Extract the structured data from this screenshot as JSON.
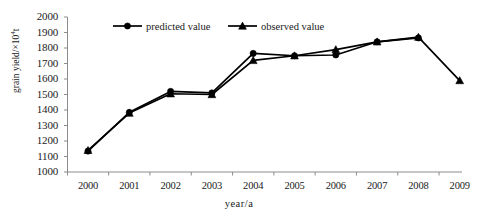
{
  "chart_data": {
    "type": "line",
    "title": "",
    "xlabel": "year/a",
    "ylabel": "grain yield/×10⁴t",
    "ylabel_base": "grain yield/×10",
    "ylabel_exp": "4",
    "ylabel_unit": "t",
    "categories": [
      "2000",
      "2001",
      "2002",
      "2003",
      "2004",
      "2005",
      "2006",
      "2007",
      "2008",
      "2009"
    ],
    "x": [
      2000,
      2001,
      2002,
      2003,
      2004,
      2005,
      2006,
      2007,
      2008,
      2009
    ],
    "xlim": [
      2000,
      2009
    ],
    "ylim": [
      1000,
      2000
    ],
    "ytick_labels": [
      "2000",
      "1900",
      "1800",
      "1700",
      "1600",
      "1500",
      "1400",
      "1300",
      "1200",
      "1100",
      "1000"
    ],
    "ytick_values": [
      2000,
      1900,
      1800,
      1700,
      1600,
      1500,
      1400,
      1300,
      1200,
      1100,
      1000
    ],
    "ytick_step": 100,
    "grid": false,
    "legend_position": "top-center",
    "series": [
      {
        "name": "predicted value",
        "marker": "circle",
        "color": "#000000",
        "values": [
          1135,
          1385,
          1520,
          1510,
          1765,
          1750,
          1755,
          1840,
          1865,
          null
        ]
      },
      {
        "name": "observed value",
        "marker": "triangle",
        "color": "#000000",
        "values": [
          1140,
          1380,
          1505,
          1500,
          1720,
          1750,
          1790,
          1840,
          1870,
          1590
        ]
      }
    ]
  },
  "legend": {
    "items": [
      {
        "label": "predicted value",
        "marker": "circle"
      },
      {
        "label": "observed value",
        "marker": "triangle"
      }
    ]
  },
  "colors": {
    "line": "#000000",
    "axis": "#808080",
    "text": "#1a1a1a",
    "background": "#ffffff"
  }
}
